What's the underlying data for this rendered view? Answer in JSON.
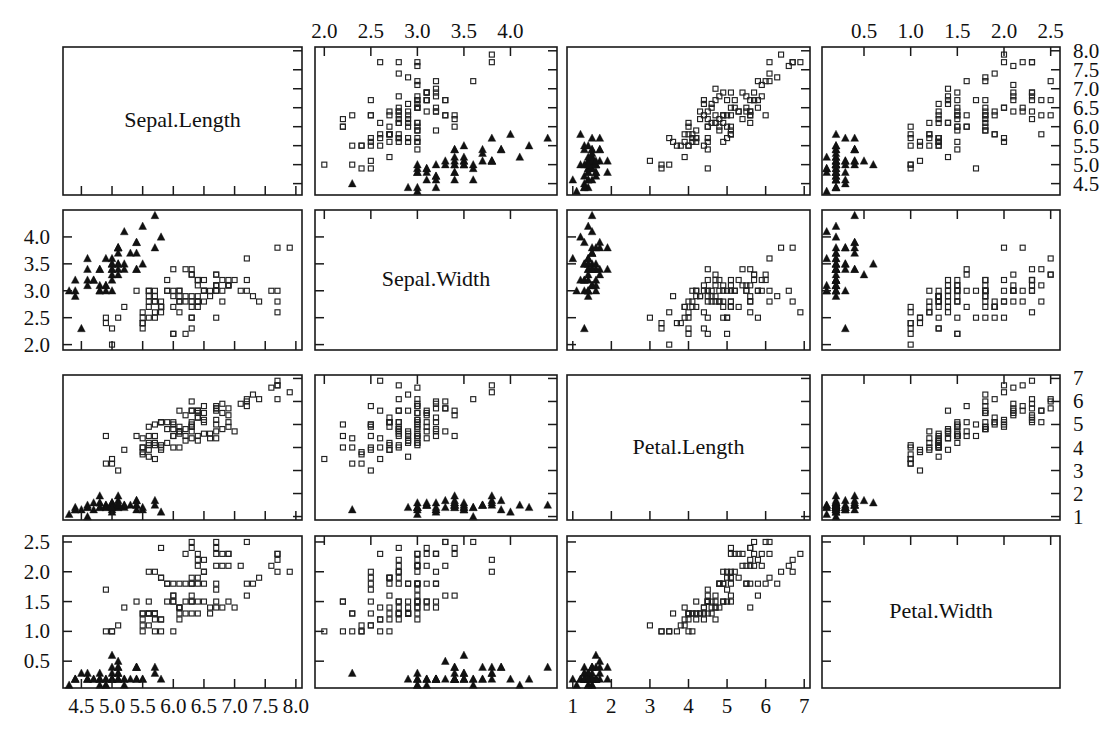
{
  "figure": {
    "kind": "scatterplot-matrix",
    "title": "",
    "background_color": "#ffffff",
    "foreground_color": "#111111",
    "width": 1119,
    "height": 735
  },
  "variables": [
    {
      "key": "Sepal.Length",
      "label": "Sepal.Length"
    },
    {
      "key": "Sepal.Width",
      "label": "Sepal.Width"
    },
    {
      "key": "Petal.Length",
      "label": "Petal.Length"
    },
    {
      "key": "Petal.Width",
      "label": "Petal.Width"
    }
  ],
  "axes": {
    "Sepal.Length": {
      "limits": [
        4.2,
        8.1
      ],
      "ticks": [
        4.5,
        5.0,
        5.5,
        6.0,
        6.5,
        7.0,
        7.5,
        8.0
      ],
      "tick_labels": [
        "4.5",
        "5.0",
        "5.5",
        "6.0",
        "6.5",
        "7.0",
        "7.5",
        "8.0"
      ]
    },
    "Sepal.Width": {
      "limits": [
        1.9,
        4.5
      ],
      "ticks": [
        2.0,
        2.5,
        3.0,
        3.5,
        4.0
      ],
      "tick_labels": [
        "2.0",
        "2.5",
        "3.0",
        "3.5",
        "4.0"
      ]
    },
    "Petal.Length": {
      "limits": [
        0.85,
        7.15
      ],
      "ticks": [
        1,
        2,
        3,
        4,
        5,
        6,
        7
      ],
      "tick_labels": [
        "1",
        "2",
        "3",
        "4",
        "5",
        "6",
        "7"
      ]
    },
    "Petal.Width": {
      "limits": [
        0.05,
        2.6
      ],
      "ticks": [
        0.5,
        1.0,
        1.5,
        2.0,
        2.5
      ],
      "tick_labels": [
        "0.5",
        "1.0",
        "1.5",
        "2.0",
        "2.5"
      ]
    }
  },
  "panel_geometry": {
    "col_left": [
      63,
      315,
      567,
      822
    ],
    "col_right": [
      302,
      557,
      810,
      1060
    ],
    "row_top": [
      47,
      210,
      375,
      536
    ],
    "row_bottom": [
      195,
      350,
      520,
      688
    ]
  },
  "axis_placement": {
    "note": "alternating axes: top axis on cols 2 and 4, bottom axis on cols 1 and 3, left axis on rows 2 and 4, right axis on rows 1 and 3",
    "top_cols": [
      1,
      3
    ],
    "bottom_cols": [
      0,
      2
    ],
    "left_rows": [
      1,
      3
    ],
    "right_rows": [
      0,
      2
    ]
  },
  "groups": [
    {
      "name": "setosa",
      "marker": "filled-triangle",
      "color": "#111111",
      "count": 50
    },
    {
      "name": "versicolor-virginica",
      "marker": "open-square",
      "color": "#222222",
      "count": 100
    }
  ],
  "chart_data": {
    "type": "scatter",
    "title": "",
    "xlabel": "",
    "ylabel": "",
    "dataset": "iris",
    "n": 150,
    "columns": [
      "Sepal.Length",
      "Sepal.Width",
      "Petal.Length",
      "Petal.Width",
      "group"
    ],
    "rows": [
      [
        5.1,
        3.5,
        1.4,
        0.2,
        0
      ],
      [
        4.9,
        3.0,
        1.4,
        0.2,
        0
      ],
      [
        4.7,
        3.2,
        1.3,
        0.2,
        0
      ],
      [
        4.6,
        3.1,
        1.5,
        0.2,
        0
      ],
      [
        5.0,
        3.6,
        1.4,
        0.2,
        0
      ],
      [
        5.4,
        3.9,
        1.7,
        0.4,
        0
      ],
      [
        4.6,
        3.4,
        1.4,
        0.3,
        0
      ],
      [
        5.0,
        3.4,
        1.5,
        0.2,
        0
      ],
      [
        4.4,
        2.9,
        1.4,
        0.2,
        0
      ],
      [
        4.9,
        3.1,
        1.5,
        0.1,
        0
      ],
      [
        5.4,
        3.7,
        1.5,
        0.2,
        0
      ],
      [
        4.8,
        3.4,
        1.6,
        0.2,
        0
      ],
      [
        4.8,
        3.0,
        1.4,
        0.1,
        0
      ],
      [
        4.3,
        3.0,
        1.1,
        0.1,
        0
      ],
      [
        5.8,
        4.0,
        1.2,
        0.2,
        0
      ],
      [
        5.7,
        4.4,
        1.5,
        0.4,
        0
      ],
      [
        5.4,
        3.9,
        1.3,
        0.4,
        0
      ],
      [
        5.1,
        3.5,
        1.4,
        0.3,
        0
      ],
      [
        5.7,
        3.8,
        1.7,
        0.3,
        0
      ],
      [
        5.1,
        3.8,
        1.5,
        0.3,
        0
      ],
      [
        5.4,
        3.4,
        1.7,
        0.2,
        0
      ],
      [
        5.1,
        3.7,
        1.5,
        0.4,
        0
      ],
      [
        4.6,
        3.6,
        1.0,
        0.2,
        0
      ],
      [
        5.1,
        3.3,
        1.7,
        0.5,
        0
      ],
      [
        4.8,
        3.4,
        1.9,
        0.2,
        0
      ],
      [
        5.0,
        3.0,
        1.6,
        0.2,
        0
      ],
      [
        5.0,
        3.4,
        1.6,
        0.4,
        0
      ],
      [
        5.2,
        3.5,
        1.5,
        0.2,
        0
      ],
      [
        5.2,
        3.4,
        1.4,
        0.2,
        0
      ],
      [
        4.7,
        3.2,
        1.6,
        0.2,
        0
      ],
      [
        4.8,
        3.1,
        1.6,
        0.2,
        0
      ],
      [
        5.4,
        3.4,
        1.5,
        0.4,
        0
      ],
      [
        5.2,
        4.1,
        1.5,
        0.1,
        0
      ],
      [
        5.5,
        4.2,
        1.4,
        0.2,
        0
      ],
      [
        4.9,
        3.1,
        1.5,
        0.2,
        0
      ],
      [
        5.0,
        3.2,
        1.2,
        0.2,
        0
      ],
      [
        5.5,
        3.5,
        1.3,
        0.2,
        0
      ],
      [
        4.9,
        3.6,
        1.4,
        0.1,
        0
      ],
      [
        4.4,
        3.0,
        1.3,
        0.2,
        0
      ],
      [
        5.1,
        3.4,
        1.5,
        0.2,
        0
      ],
      [
        5.0,
        3.5,
        1.3,
        0.3,
        0
      ],
      [
        4.5,
        2.3,
        1.3,
        0.3,
        0
      ],
      [
        4.4,
        3.2,
        1.3,
        0.2,
        0
      ],
      [
        5.0,
        3.5,
        1.6,
        0.6,
        0
      ],
      [
        5.1,
        3.8,
        1.9,
        0.4,
        0
      ],
      [
        4.8,
        3.0,
        1.4,
        0.3,
        0
      ],
      [
        5.1,
        3.8,
        1.6,
        0.2,
        0
      ],
      [
        4.6,
        3.2,
        1.4,
        0.2,
        0
      ],
      [
        5.3,
        3.7,
        1.5,
        0.2,
        0
      ],
      [
        5.0,
        3.3,
        1.4,
        0.2,
        0
      ],
      [
        7.0,
        3.2,
        4.7,
        1.4,
        1
      ],
      [
        6.4,
        3.2,
        4.5,
        1.5,
        1
      ],
      [
        6.9,
        3.1,
        4.9,
        1.5,
        1
      ],
      [
        5.5,
        2.3,
        4.0,
        1.3,
        1
      ],
      [
        6.5,
        2.8,
        4.6,
        1.5,
        1
      ],
      [
        5.7,
        2.8,
        4.5,
        1.3,
        1
      ],
      [
        6.3,
        3.3,
        4.7,
        1.6,
        1
      ],
      [
        4.9,
        2.4,
        3.3,
        1.0,
        1
      ],
      [
        6.6,
        2.9,
        4.6,
        1.3,
        1
      ],
      [
        5.2,
        2.7,
        3.9,
        1.4,
        1
      ],
      [
        5.0,
        2.0,
        3.5,
        1.0,
        1
      ],
      [
        5.9,
        3.0,
        4.2,
        1.5,
        1
      ],
      [
        6.0,
        2.2,
        4.0,
        1.0,
        1
      ],
      [
        6.1,
        2.9,
        4.7,
        1.4,
        1
      ],
      [
        5.6,
        2.9,
        3.6,
        1.3,
        1
      ],
      [
        6.7,
        3.1,
        4.4,
        1.4,
        1
      ],
      [
        5.6,
        3.0,
        4.5,
        1.5,
        1
      ],
      [
        5.8,
        2.7,
        4.1,
        1.0,
        1
      ],
      [
        6.2,
        2.2,
        4.5,
        1.5,
        1
      ],
      [
        5.6,
        2.5,
        3.9,
        1.1,
        1
      ],
      [
        5.9,
        3.2,
        4.8,
        1.8,
        1
      ],
      [
        6.1,
        2.8,
        4.0,
        1.3,
        1
      ],
      [
        6.3,
        2.5,
        4.9,
        1.5,
        1
      ],
      [
        6.1,
        2.8,
        4.7,
        1.2,
        1
      ],
      [
        6.4,
        2.9,
        4.3,
        1.3,
        1
      ],
      [
        6.6,
        3.0,
        4.4,
        1.4,
        1
      ],
      [
        6.8,
        2.8,
        4.8,
        1.4,
        1
      ],
      [
        6.7,
        3.0,
        5.0,
        1.7,
        1
      ],
      [
        6.0,
        2.9,
        4.5,
        1.5,
        1
      ],
      [
        5.7,
        2.6,
        3.5,
        1.0,
        1
      ],
      [
        5.5,
        2.4,
        3.8,
        1.1,
        1
      ],
      [
        5.5,
        2.4,
        3.7,
        1.0,
        1
      ],
      [
        5.8,
        2.7,
        3.9,
        1.2,
        1
      ],
      [
        6.0,
        2.7,
        5.1,
        1.6,
        1
      ],
      [
        5.4,
        3.0,
        4.5,
        1.5,
        1
      ],
      [
        6.0,
        3.4,
        4.5,
        1.6,
        1
      ],
      [
        6.7,
        3.1,
        4.7,
        1.5,
        1
      ],
      [
        6.3,
        2.3,
        4.4,
        1.3,
        1
      ],
      [
        5.6,
        3.0,
        4.1,
        1.3,
        1
      ],
      [
        5.5,
        2.5,
        4.0,
        1.3,
        1
      ],
      [
        5.5,
        2.6,
        4.4,
        1.2,
        1
      ],
      [
        6.1,
        3.0,
        4.6,
        1.4,
        1
      ],
      [
        5.8,
        2.6,
        4.0,
        1.2,
        1
      ],
      [
        5.0,
        2.3,
        3.3,
        1.0,
        1
      ],
      [
        5.6,
        2.7,
        4.2,
        1.3,
        1
      ],
      [
        5.7,
        3.0,
        4.2,
        1.2,
        1
      ],
      [
        5.7,
        2.9,
        4.2,
        1.3,
        1
      ],
      [
        6.2,
        2.9,
        4.3,
        1.3,
        1
      ],
      [
        5.1,
        2.5,
        3.0,
        1.1,
        1
      ],
      [
        5.7,
        2.8,
        4.1,
        1.3,
        1
      ],
      [
        6.3,
        3.3,
        6.0,
        2.5,
        1
      ],
      [
        5.8,
        2.7,
        5.1,
        1.9,
        1
      ],
      [
        7.1,
        3.0,
        5.9,
        2.1,
        1
      ],
      [
        6.3,
        2.9,
        5.6,
        1.8,
        1
      ],
      [
        6.5,
        3.0,
        5.8,
        2.2,
        1
      ],
      [
        7.6,
        3.0,
        6.6,
        2.1,
        1
      ],
      [
        4.9,
        2.5,
        4.5,
        1.7,
        1
      ],
      [
        7.3,
        2.9,
        6.3,
        1.8,
        1
      ],
      [
        6.7,
        2.5,
        5.8,
        1.8,
        1
      ],
      [
        7.2,
        3.6,
        6.1,
        2.5,
        1
      ],
      [
        6.5,
        3.2,
        5.1,
        2.0,
        1
      ],
      [
        6.4,
        2.7,
        5.3,
        1.9,
        1
      ],
      [
        6.8,
        3.0,
        5.5,
        2.1,
        1
      ],
      [
        5.7,
        2.5,
        5.0,
        2.0,
        1
      ],
      [
        5.8,
        2.8,
        5.1,
        2.4,
        1
      ],
      [
        6.4,
        3.2,
        5.3,
        2.3,
        1
      ],
      [
        6.5,
        3.0,
        5.5,
        1.8,
        1
      ],
      [
        7.7,
        3.8,
        6.7,
        2.2,
        1
      ],
      [
        7.7,
        2.6,
        6.9,
        2.3,
        1
      ],
      [
        6.0,
        2.2,
        5.0,
        1.5,
        1
      ],
      [
        6.9,
        3.2,
        5.7,
        2.3,
        1
      ],
      [
        5.6,
        2.8,
        4.9,
        2.0,
        1
      ],
      [
        7.7,
        2.8,
        6.7,
        2.0,
        1
      ],
      [
        6.3,
        2.7,
        4.9,
        1.8,
        1
      ],
      [
        6.7,
        3.3,
        5.7,
        2.1,
        1
      ],
      [
        7.2,
        3.2,
        6.0,
        1.8,
        1
      ],
      [
        6.2,
        2.8,
        4.8,
        1.8,
        1
      ],
      [
        6.1,
        3.0,
        4.9,
        1.8,
        1
      ],
      [
        6.4,
        2.8,
        5.6,
        2.1,
        1
      ],
      [
        7.2,
        3.0,
        5.8,
        1.6,
        1
      ],
      [
        7.4,
        2.8,
        6.1,
        1.9,
        1
      ],
      [
        7.9,
        3.8,
        6.4,
        2.0,
        1
      ],
      [
        6.4,
        2.8,
        5.6,
        2.2,
        1
      ],
      [
        6.3,
        2.8,
        5.1,
        1.5,
        1
      ],
      [
        6.1,
        2.6,
        5.6,
        1.4,
        1
      ],
      [
        7.7,
        3.0,
        6.1,
        2.3,
        1
      ],
      [
        6.3,
        3.4,
        5.6,
        2.4,
        1
      ],
      [
        6.4,
        3.1,
        5.5,
        1.8,
        1
      ],
      [
        6.0,
        3.0,
        4.8,
        1.8,
        1
      ],
      [
        6.9,
        3.1,
        5.4,
        2.1,
        1
      ],
      [
        6.7,
        3.1,
        5.6,
        2.4,
        1
      ],
      [
        6.9,
        3.1,
        5.1,
        2.3,
        1
      ],
      [
        5.8,
        2.7,
        5.1,
        1.9,
        1
      ],
      [
        6.8,
        3.2,
        5.9,
        2.3,
        1
      ],
      [
        6.7,
        3.3,
        5.7,
        2.5,
        1
      ],
      [
        6.7,
        3.0,
        5.2,
        2.3,
        1
      ],
      [
        6.3,
        2.5,
        5.0,
        1.9,
        1
      ],
      [
        6.5,
        3.0,
        5.2,
        2.0,
        1
      ],
      [
        6.2,
        3.4,
        5.4,
        2.3,
        1
      ],
      [
        5.9,
        3.0,
        5.1,
        1.8,
        1
      ]
    ]
  }
}
